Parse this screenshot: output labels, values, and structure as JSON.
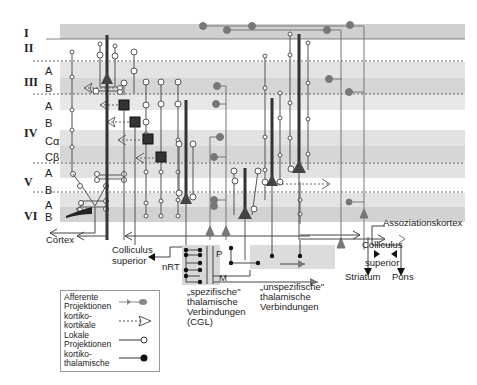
{
  "layers": [
    {
      "roman": "I",
      "sublayers": []
    },
    {
      "roman": "II",
      "sublayers": []
    },
    {
      "roman": "III",
      "sublayers": [
        "A",
        "B"
      ]
    },
    {
      "roman": "IV",
      "sublayers": [
        "A",
        "B",
        "Cα",
        "Cβ"
      ]
    },
    {
      "roman": "V",
      "sublayers": [
        "A",
        "B"
      ]
    },
    {
      "roman": "VI",
      "sublayers": [
        "A",
        "B"
      ]
    }
  ],
  "labels": {
    "cortex": "Cortex",
    "colliculus_superior_left_1": "Colliculus",
    "colliculus_superior_left_2": "superior",
    "nrt": "nRT",
    "p": "P",
    "m": "M",
    "spezifische_1": "„spezifische\"",
    "spezifische_2": "thalamische",
    "spezifische_3": "Verbindungen",
    "spezifische_4": "(CGL)",
    "unspezifische_1": "„unspezifische\"",
    "unspezifische_2": "thalamische",
    "unspezifische_3": "Verbindungen",
    "assoziationskortex": "Assoziationskortex",
    "colliculus_right_1": "Colliculus",
    "colliculus_right_2": "superior",
    "striatum": "Striatum",
    "pons": "Pons"
  },
  "legend": {
    "items": [
      {
        "label1": "Afferente",
        "label2": "Projektionen",
        "symbol": "afferent-gray-dot"
      },
      {
        "label1": "kortiko-",
        "label2": "kortikale",
        "symbol": "dashed-open-arrow"
      },
      {
        "label1": "Lokale",
        "label2": "Projektionen",
        "symbol": "open-circle"
      },
      {
        "label1": "kortiko-",
        "label2": "thalamische",
        "symbol": "filled-circle"
      }
    ]
  },
  "colors": {
    "band_dark": "#d4d4d4",
    "band_light": "#e6e6e6",
    "line": "#555555",
    "afferent": "#888888",
    "neuron_body": "#444444"
  }
}
